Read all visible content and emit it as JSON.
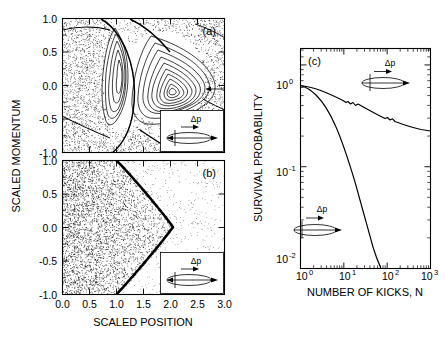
{
  "figure": {
    "panels": [
      "(a)",
      "(b)",
      "(c)"
    ],
    "background": "#ffffff",
    "ink": "#000000"
  },
  "panel_a": {
    "label": "(a)",
    "inset": {
      "delta_p_label": "Δp",
      "shape": "ellipse-with-arrows"
    }
  },
  "panel_b": {
    "label": "(b)",
    "inset": {
      "delta_p_label": "Δp",
      "shape": "ellipse-with-arrows"
    }
  },
  "panel_c": {
    "label": "(c)",
    "inset_upper": {
      "delta_p_label": "Δp",
      "shape": "ellipse-with-arrows"
    },
    "inset_lower": {
      "delta_p_label": "Δp",
      "shape": "ellipse-with-arrows"
    }
  },
  "axes": {
    "shared_y_label": "SCALED  MOMENTUM",
    "shared_x_label": "SCALED  POSITION",
    "c_y_label": "SURVIVAL PROBABILITY",
    "c_x_label": "NUMBER  OF  KICKS, N",
    "y_ticks": [
      "1.0",
      "0.5",
      "0.0",
      "-0.5",
      "-1.0"
    ],
    "x_ticks": [
      "0.0",
      "0.5",
      "1.0",
      "1.5",
      "2.0",
      "2.5",
      "3.0"
    ],
    "c_y_ticks": [
      "10",
      "10",
      "10"
    ],
    "c_y_exps": [
      "0",
      "-1",
      "-2"
    ],
    "c_x_ticks": [
      "10",
      "10",
      "10",
      "10"
    ],
    "c_x_exps": [
      "0",
      "1",
      "2",
      "3"
    ]
  },
  "chart_data": [
    {
      "type": "scatter",
      "title": "(a) Poincare surface of section - mixed phase space",
      "xlabel": "SCALED  POSITION",
      "ylabel": "SCALED  MOMENTUM",
      "xlim": [
        0.0,
        3.0
      ],
      "ylim": [
        -1.0,
        1.0
      ],
      "xticks": [
        0.0,
        0.5,
        1.0,
        1.5,
        2.0,
        2.5,
        3.0
      ],
      "yticks": [
        -1.0,
        -0.5,
        0.0,
        0.5,
        1.0
      ],
      "grid": false,
      "description": "Chaotic sea of scattered points with two nested island chains (KAM tori). Large triangular island centered near x=1.85, p=0.12 with ~10 nested invariant curves; a smaller crescent island near x=1.05, p=0.05.",
      "features": {
        "main_island_center": [
          1.85,
          0.12
        ],
        "main_island_n_tori": 10,
        "secondary_island_center": [
          1.05,
          0.05
        ],
        "secondary_island_n_tori": 4,
        "separatrix_present": true
      }
    },
    {
      "type": "scatter",
      "title": "(b) Poincare surface of section - fully chaotic",
      "xlabel": "SCALED  POSITION",
      "ylabel": "SCALED  MOMENTUM",
      "xlim": [
        0.0,
        3.0
      ],
      "ylim": [
        -1.0,
        1.0
      ],
      "xticks": [
        0.0,
        0.5,
        1.0,
        1.5,
        2.0,
        2.5,
        3.0
      ],
      "yticks": [
        -1.0,
        -0.5,
        0.0,
        0.5,
        1.0
      ],
      "grid": false,
      "description": "Dense chaotic sea filling left region, bounded on the right by a sharp chevron-shaped dark boundary curve with apex near x=2.05, p=0.0; boundary passes through x=1.0 at p=+1.0 and x=1.0 at p=-1.0.",
      "boundary_curve": {
        "p": [
          1.0,
          0.75,
          0.5,
          0.25,
          0.0,
          -0.25,
          -0.5,
          -0.75,
          -1.0
        ],
        "x": [
          1.0,
          1.35,
          1.62,
          1.87,
          2.05,
          1.85,
          1.6,
          1.32,
          1.0
        ]
      }
    },
    {
      "type": "line",
      "title": "(c) Survival probability vs number of kicks",
      "xlabel": "NUMBER  OF  KICKS, N",
      "ylabel": "SURVIVAL PROBABILITY",
      "xscale": "log",
      "yscale": "log",
      "xlim": [
        1,
        1000
      ],
      "ylim": [
        0.01,
        1.45
      ],
      "xticks": [
        1,
        10,
        100,
        1000
      ],
      "xticklabels": [
        "10^0",
        "10^1",
        "10^2",
        "10^3"
      ],
      "yticks": [
        0.01,
        0.1,
        1
      ],
      "yticklabels": [
        "10^-2",
        "10^-1",
        "10^0"
      ],
      "grid": false,
      "legend": "none",
      "series": [
        {
          "name": "power-law decay (mixed phase space, panel a)",
          "x": [
            1,
            1.6,
            2.5,
            4,
            6.3,
            10,
            16,
            25,
            40,
            63,
            100,
            160,
            250,
            400,
            630,
            1000
          ],
          "y": [
            1.0,
            0.99,
            0.975,
            0.955,
            0.93,
            0.905,
            0.875,
            0.845,
            0.8,
            0.76,
            0.72,
            0.68,
            0.645,
            0.615,
            0.59,
            0.57
          ]
        },
        {
          "name": "exponential decay (chaotic, panel b)",
          "x": [
            1,
            1.6,
            2.5,
            4,
            6.3,
            10,
            16,
            25,
            40,
            63,
            100,
            125
          ],
          "y": [
            1.0,
            0.96,
            0.9,
            0.79,
            0.63,
            0.45,
            0.275,
            0.14,
            0.058,
            0.022,
            0.011,
            0.0095
          ]
        }
      ]
    }
  ]
}
